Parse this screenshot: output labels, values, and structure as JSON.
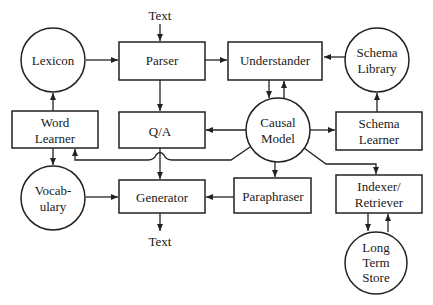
{
  "diagram": {
    "nodes": {
      "lexicon": {
        "label": [
          "Lexicon"
        ],
        "shape": "circle"
      },
      "parser": {
        "label": [
          "Parser"
        ],
        "shape": "box"
      },
      "understander": {
        "label": [
          "Understander"
        ],
        "shape": "box"
      },
      "schema_library": {
        "label": [
          "Schema",
          "Library"
        ],
        "shape": "circle"
      },
      "word_learner": {
        "label": [
          "Word",
          "Learner"
        ],
        "shape": "box"
      },
      "qa": {
        "label": [
          "Q/A"
        ],
        "shape": "box"
      },
      "causal_model": {
        "label": [
          "Causal",
          "Model"
        ],
        "shape": "circle"
      },
      "schema_learner": {
        "label": [
          "Schema",
          "Learner"
        ],
        "shape": "box"
      },
      "vocabulary": {
        "label": [
          "Vocab-",
          "ulary"
        ],
        "shape": "circle"
      },
      "generator": {
        "label": [
          "Generator"
        ],
        "shape": "box"
      },
      "paraphraser": {
        "label": [
          "Paraphraser"
        ],
        "shape": "box"
      },
      "indexer_retriever": {
        "label": [
          "Indexer/",
          "Retriever"
        ],
        "shape": "box"
      },
      "long_term_store": {
        "label": [
          "Long",
          "Term",
          "Store"
        ],
        "shape": "circle"
      }
    },
    "io_labels": {
      "input_text": "Text",
      "output_text": "Text"
    },
    "edges": [
      {
        "from": "input_text",
        "to": "parser"
      },
      {
        "from": "lexicon",
        "to": "parser"
      },
      {
        "from": "parser",
        "to": "understander"
      },
      {
        "from": "schema_library",
        "to": "understander"
      },
      {
        "from": "understander",
        "to": "causal_model"
      },
      {
        "from": "causal_model",
        "to": "understander"
      },
      {
        "from": "parser",
        "to": "qa"
      },
      {
        "from": "word_learner",
        "to": "lexicon"
      },
      {
        "from": "causal_model",
        "to": "qa"
      },
      {
        "from": "causal_model",
        "to": "schema_learner"
      },
      {
        "from": "schema_learner",
        "to": "schema_library"
      },
      {
        "from": "causal_model",
        "to": "word_learner"
      },
      {
        "from": "word_learner",
        "to": "vocabulary"
      },
      {
        "from": "qa",
        "to": "generator"
      },
      {
        "from": "causal_model",
        "to": "paraphraser"
      },
      {
        "from": "causal_model",
        "to": "indexer_retriever"
      },
      {
        "from": "vocabulary",
        "to": "generator"
      },
      {
        "from": "paraphraser",
        "to": "generator"
      },
      {
        "from": "generator",
        "to": "output_text"
      },
      {
        "from": "indexer_retriever",
        "to": "long_term_store"
      },
      {
        "from": "long_term_store",
        "to": "indexer_retriever"
      }
    ]
  }
}
